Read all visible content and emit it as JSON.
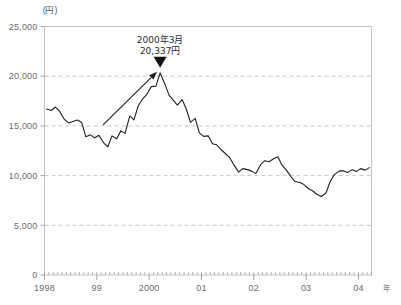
{
  "chart_data": {
    "type": "line",
    "title": "",
    "xlabel": "年",
    "ylabel": "(円)",
    "yunit_label": "(円)",
    "xunit_label": "年",
    "ylim": [
      0,
      25000
    ],
    "xlim": [
      1998.0,
      2004.25
    ],
    "grid": true,
    "gridlines_at": [
      5000,
      10000,
      15000,
      20000
    ],
    "legend": "none",
    "ytick_labels": [
      "25,000",
      "20,000",
      "15,000",
      "10,000",
      "5,000",
      "0"
    ],
    "ytick_values": [
      25000,
      20000,
      15000,
      10000,
      5000,
      0
    ],
    "xtick_labels": [
      "1998",
      "99",
      "2000",
      "01",
      "02",
      "03",
      "04"
    ],
    "xtick_values": [
      1998,
      1999,
      2000,
      2001,
      2002,
      2003,
      2004
    ],
    "minor_tick_interval_months": 1,
    "series": [
      {
        "name": "株価",
        "x": [
          1998.04,
          1998.13,
          1998.21,
          1998.29,
          1998.38,
          1998.46,
          1998.54,
          1998.63,
          1998.71,
          1998.79,
          1998.88,
          1998.96,
          1999.04,
          1999.13,
          1999.21,
          1999.29,
          1999.38,
          1999.46,
          1999.54,
          1999.63,
          1999.71,
          1999.79,
          1999.88,
          1999.96,
          2000.04,
          2000.13,
          2000.21,
          2000.29,
          2000.38,
          2000.46,
          2000.54,
          2000.63,
          2000.71,
          2000.79,
          2000.88,
          2000.96,
          2001.04,
          2001.13,
          2001.21,
          2001.29,
          2001.38,
          2001.46,
          2001.54,
          2001.63,
          2001.71,
          2001.79,
          2001.88,
          2001.96,
          2002.04,
          2002.13,
          2002.21,
          2002.29,
          2002.38,
          2002.46,
          2002.54,
          2002.63,
          2002.71,
          2002.79,
          2002.88,
          2002.96,
          2003.04,
          2003.13,
          2003.21,
          2003.29,
          2003.38,
          2003.46,
          2003.54,
          2003.63,
          2003.71,
          2003.79,
          2003.88,
          2003.96,
          2004.04,
          2004.13,
          2004.21
        ],
        "values": [
          16700,
          16550,
          16900,
          16450,
          15650,
          15300,
          15450,
          15600,
          15350,
          13900,
          14100,
          13800,
          14050,
          13300,
          12900,
          14000,
          13700,
          14500,
          14250,
          16000,
          15600,
          17000,
          17750,
          18200,
          18950,
          19000,
          20337,
          19350,
          18100,
          17600,
          17100,
          17650,
          16700,
          15350,
          15750,
          14300,
          13950,
          14000,
          13200,
          13100,
          12600,
          12200,
          11800,
          11000,
          10350,
          10700,
          10600,
          10450,
          10200,
          11100,
          11500,
          11400,
          11700,
          11900,
          11050,
          10500,
          9900,
          9400,
          9300,
          9100,
          8700,
          8450,
          8100,
          7900,
          8250,
          9400,
          10100,
          10450,
          10500,
          10300,
          10600,
          10400,
          10700,
          10550,
          10800
        ]
      }
    ],
    "annotations": [
      {
        "name": "peak-callout",
        "line1": "2000年3月",
        "line2": "20,337円",
        "x": 2000.21,
        "y": 20337,
        "marker": "triangle-down"
      },
      {
        "name": "rise-arrow",
        "type": "arrow",
        "from_x": 1999.12,
        "from_y": 15100,
        "to_x": 2000.15,
        "to_y": 20450
      }
    ]
  }
}
